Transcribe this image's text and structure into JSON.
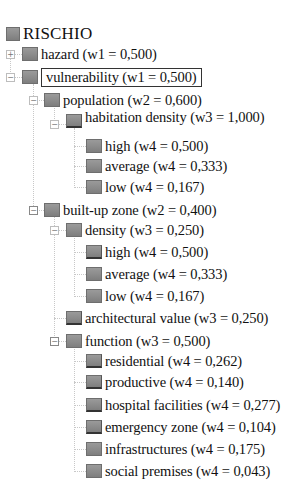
{
  "tree": {
    "root": {
      "label": "RISCHIO"
    },
    "hazard": {
      "label": "hazard (w1 = 0,500)",
      "expanded": false
    },
    "vulnerability": {
      "label": "vulnerability (w1 = 0,500)",
      "expanded": true,
      "selected": true
    },
    "population": {
      "label": "population (w2 = 0,600)",
      "expanded": true
    },
    "habitation_density": {
      "label": "habitation density (w3 = 1,000)",
      "expanded": true
    },
    "hd_high": {
      "label": "high (w4 = 0,500)"
    },
    "hd_average": {
      "label": "average (w4 = 0,333)"
    },
    "hd_low": {
      "label": "low (w4 = 0,167)"
    },
    "built_up_zone": {
      "label": "built-up zone (w2 = 0,400)",
      "expanded": true
    },
    "density": {
      "label": "density (w3 = 0,250)",
      "expanded": true
    },
    "d_high": {
      "label": "high (w4 = 0,500)"
    },
    "d_average": {
      "label": "average (w4 = 0,333)"
    },
    "d_low": {
      "label": "low (w4 = 0,167)"
    },
    "architectural_value": {
      "label": "architectural value (w3 = 0,250)"
    },
    "function": {
      "label": "function (w3 = 0,500)",
      "expanded": true
    },
    "f_residential": {
      "label": "residential (w4 = 0,262)"
    },
    "f_productive": {
      "label": "productive (w4 = 0,140)"
    },
    "f_hospital": {
      "label": "hospital facilities (w4 = 0,277)"
    },
    "f_emergency": {
      "label": "emergency zone (w4 = 0,104)"
    },
    "f_infrastructures": {
      "label": "infrastructures (w4 = 0,175)"
    },
    "f_social": {
      "label": "social premises (w4 = 0,043)"
    }
  },
  "toggles": {
    "expand": "+",
    "collapse": "−"
  },
  "colors": {
    "icon_fill": "#8f8f8f",
    "connector": "#c8c8c8",
    "selection_border": "#333333"
  }
}
